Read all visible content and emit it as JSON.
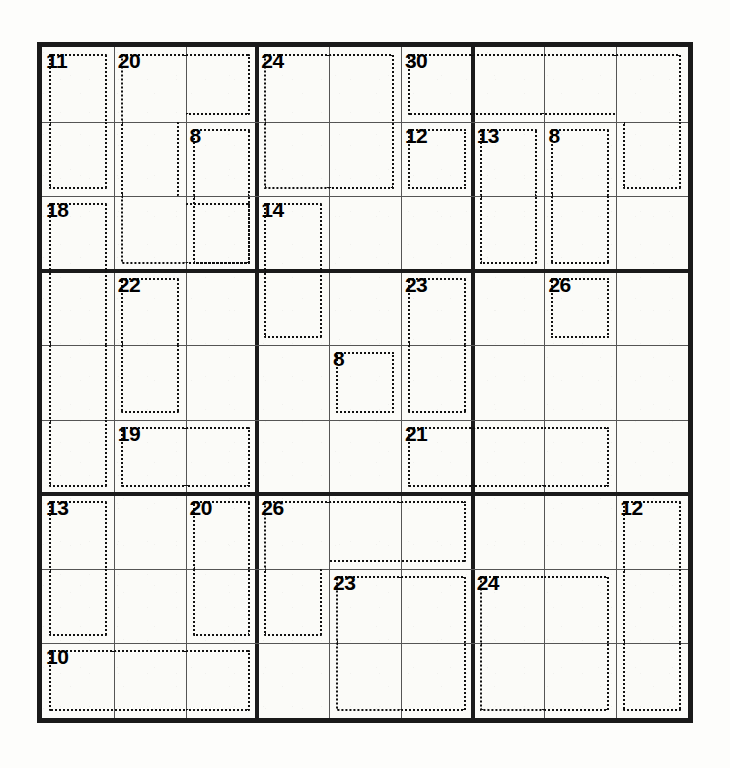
{
  "puzzle": {
    "type": "killer-sudoku",
    "title": "Killer Sudoku",
    "grid_size": 9,
    "box_size": 3,
    "given_digits": [],
    "cell_values": [
      [
        "",
        "",
        "",
        "",
        "",
        "",
        "",
        "",
        ""
      ],
      [
        "",
        "",
        "",
        "",
        "",
        "",
        "",
        "",
        ""
      ],
      [
        "",
        "",
        "",
        "",
        "",
        "",
        "",
        "",
        ""
      ],
      [
        "",
        "",
        "",
        "",
        "",
        "",
        "",
        "",
        ""
      ],
      [
        "",
        "",
        "",
        "",
        "",
        "",
        "",
        "",
        ""
      ],
      [
        "",
        "",
        "",
        "",
        "",
        "",
        "",
        "",
        ""
      ],
      [
        "",
        "",
        "",
        "",
        "",
        "",
        "",
        "",
        ""
      ],
      [
        "",
        "",
        "",
        "",
        "",
        "",
        "",
        "",
        ""
      ],
      [
        "",
        "",
        "",
        "",
        "",
        "",
        "",
        "",
        ""
      ]
    ],
    "colors": {
      "paper": "#fdfdfb",
      "grid_background": "#fbfbf8",
      "outer_border": "#1a1a1a",
      "box_border": "#1a1a1a",
      "cell_line": "#555555",
      "cage_dash": "#111111",
      "sum_text": "#000000"
    },
    "cages": [
      {
        "sum": "11",
        "anchor_row": 1,
        "anchor_col": 1,
        "cells": [
          [
            1,
            1
          ],
          [
            2,
            1
          ]
        ]
      },
      {
        "sum": "20",
        "anchor_row": 1,
        "anchor_col": 2,
        "cells": [
          [
            1,
            2
          ],
          [
            1,
            3
          ],
          [
            2,
            2
          ],
          [
            3,
            2
          ],
          [
            3,
            3
          ]
        ]
      },
      {
        "sum": "8",
        "anchor_row": 2,
        "anchor_col": 3,
        "cells": [
          [
            2,
            3
          ],
          [
            3,
            3
          ]
        ]
      },
      {
        "sum": "24",
        "anchor_row": 1,
        "anchor_col": 4,
        "cells": [
          [
            1,
            4
          ],
          [
            1,
            5
          ],
          [
            2,
            4
          ],
          [
            2,
            5
          ]
        ]
      },
      {
        "sum": "30",
        "anchor_row": 1,
        "anchor_col": 6,
        "cells": [
          [
            1,
            6
          ],
          [
            1,
            7
          ],
          [
            1,
            8
          ],
          [
            1,
            9
          ],
          [
            2,
            9
          ]
        ]
      },
      {
        "sum": "12",
        "anchor_row": 2,
        "anchor_col": 6,
        "cells": [
          [
            2,
            6
          ]
        ]
      },
      {
        "sum": "13",
        "anchor_row": 2,
        "anchor_col": 7,
        "cells": [
          [
            2,
            7
          ],
          [
            3,
            7
          ]
        ]
      },
      {
        "sum": "8",
        "anchor_row": 2,
        "anchor_col": 8,
        "cells": [
          [
            2,
            8
          ],
          [
            3,
            8
          ]
        ]
      },
      {
        "sum": "18",
        "anchor_row": 3,
        "anchor_col": 1,
        "cells": [
          [
            3,
            1
          ],
          [
            4,
            1
          ],
          [
            5,
            1
          ],
          [
            6,
            1
          ]
        ]
      },
      {
        "sum": "14",
        "anchor_row": 3,
        "anchor_col": 4,
        "cells": [
          [
            3,
            4
          ],
          [
            4,
            4
          ]
        ]
      },
      {
        "sum": "22",
        "anchor_row": 4,
        "anchor_col": 2,
        "cells": [
          [
            4,
            2
          ],
          [
            5,
            2
          ]
        ]
      },
      {
        "sum": "23",
        "anchor_row": 4,
        "anchor_col": 6,
        "cells": [
          [
            4,
            6
          ],
          [
            5,
            6
          ]
        ]
      },
      {
        "sum": "26",
        "anchor_row": 4,
        "anchor_col": 8,
        "cells": [
          [
            4,
            8
          ]
        ]
      },
      {
        "sum": "8",
        "anchor_row": 5,
        "anchor_col": 5,
        "cells": [
          [
            5,
            5
          ]
        ]
      },
      {
        "sum": "19",
        "anchor_row": 6,
        "anchor_col": 2,
        "cells": [
          [
            6,
            2
          ],
          [
            6,
            3
          ]
        ]
      },
      {
        "sum": "21",
        "anchor_row": 6,
        "anchor_col": 6,
        "cells": [
          [
            6,
            6
          ],
          [
            6,
            7
          ],
          [
            6,
            8
          ]
        ]
      },
      {
        "sum": "13",
        "anchor_row": 7,
        "anchor_col": 1,
        "cells": [
          [
            7,
            1
          ],
          [
            8,
            1
          ]
        ]
      },
      {
        "sum": "20",
        "anchor_row": 7,
        "anchor_col": 3,
        "cells": [
          [
            7,
            3
          ],
          [
            8,
            3
          ]
        ]
      },
      {
        "sum": "26",
        "anchor_row": 7,
        "anchor_col": 4,
        "cells": [
          [
            7,
            4
          ],
          [
            7,
            5
          ],
          [
            7,
            6
          ],
          [
            8,
            4
          ]
        ]
      },
      {
        "sum": "12",
        "anchor_row": 7,
        "anchor_col": 9,
        "cells": [
          [
            7,
            9
          ],
          [
            8,
            9
          ],
          [
            9,
            9
          ]
        ]
      },
      {
        "sum": "23",
        "anchor_row": 8,
        "anchor_col": 5,
        "cells": [
          [
            8,
            5
          ],
          [
            8,
            6
          ],
          [
            9,
            5
          ],
          [
            9,
            6
          ]
        ]
      },
      {
        "sum": "24",
        "anchor_row": 8,
        "anchor_col": 7,
        "cells": [
          [
            8,
            7
          ],
          [
            8,
            8
          ],
          [
            9,
            7
          ],
          [
            9,
            8
          ]
        ]
      },
      {
        "sum": "10",
        "anchor_row": 9,
        "anchor_col": 1,
        "cells": [
          [
            9,
            1
          ],
          [
            9,
            2
          ],
          [
            9,
            3
          ]
        ]
      }
    ],
    "cage_sums_reading_order": [
      "11",
      "20",
      "24",
      "30",
      "8",
      "12",
      "13",
      "8",
      "18",
      "14",
      "22",
      "23",
      "26",
      "8",
      "19",
      "21",
      "13",
      "20",
      "26",
      "12",
      "23",
      "24",
      "10"
    ]
  }
}
